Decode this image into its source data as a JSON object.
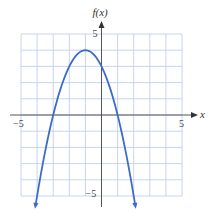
{
  "chart_data": {
    "type": "line",
    "title": "",
    "xlabel": "x",
    "ylabel": "f(x)",
    "xlim": [
      -5,
      5
    ],
    "ylim": [
      -5,
      5
    ],
    "grid": true,
    "grid_step": 1,
    "tick_labels": {
      "x_neg": "−5",
      "x_pos": "5",
      "y_pos": "5",
      "y_neg": "−5"
    },
    "series": [
      {
        "name": "f(x) = -x^2 - 2x + 3",
        "x": [
          -4.1,
          -4,
          -3,
          -2,
          -1,
          0,
          1,
          2,
          2.1
        ],
        "values": [
          -5.61,
          -5,
          0,
          3,
          4,
          3,
          0,
          -5,
          -5.61
        ],
        "color": "#3d6cc8"
      }
    ],
    "annotations": {
      "vertex": [
        -1,
        4
      ],
      "x_intercepts": [
        -3,
        1
      ],
      "y_intercept": 3
    }
  },
  "colors": {
    "grid": "#b9c9ee",
    "axis": "#555555",
    "curve": "#3d6cc8"
  }
}
